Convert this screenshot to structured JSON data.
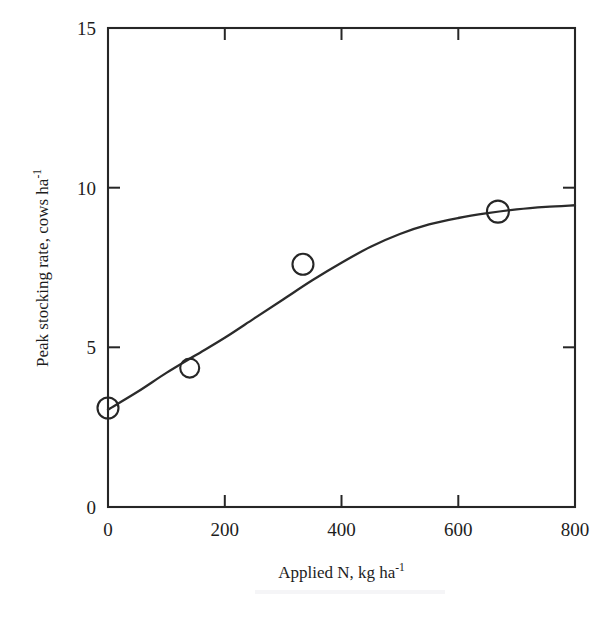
{
  "figure": {
    "background_color": "#ffffff",
    "ink_color": "#262626"
  },
  "chart_data": {
    "type": "line",
    "title": "",
    "xlabel_text": "Applied N, kg ha",
    "xlabel_exponent": "-1",
    "ylabel_text": "Peak stocking rate, cows ha",
    "ylabel_exponent": "-1",
    "xlim": [
      0,
      800
    ],
    "ylim": [
      0,
      15
    ],
    "xticks": [
      0,
      200,
      400,
      600,
      800
    ],
    "xtick_labels": [
      "0",
      "200",
      "400",
      "600",
      "800"
    ],
    "yticks": [
      0,
      5,
      10,
      15
    ],
    "ytick_labels": [
      "0",
      "5",
      "10",
      "15"
    ],
    "grid": false,
    "legend": false,
    "marker_style": "open-circle",
    "x": [
      0,
      140,
      334,
      668
    ],
    "values": [
      3.1,
      4.35,
      7.6,
      9.25
    ],
    "series": [
      {
        "name": "Peak stocking rate",
        "x": [
          0,
          140,
          334,
          668
        ],
        "values": [
          3.1,
          4.35,
          7.6,
          9.25
        ]
      }
    ],
    "fitted_curve": {
      "name": "fitted response curve",
      "x": [
        0,
        50,
        100,
        150,
        200,
        250,
        300,
        350,
        400,
        450,
        500,
        550,
        600,
        650,
        700,
        750,
        800
      ],
      "y": [
        3.05,
        3.6,
        4.2,
        4.75,
        5.3,
        5.9,
        6.5,
        7.1,
        7.65,
        8.15,
        8.55,
        8.85,
        9.05,
        9.2,
        9.32,
        9.4,
        9.45
      ]
    }
  }
}
